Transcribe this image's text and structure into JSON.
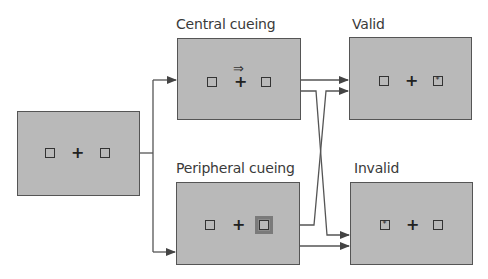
{
  "diagram": {
    "type": "flow",
    "nodes": [
      {
        "id": "fixation",
        "label": "",
        "content": {
          "left": "box",
          "center": "+",
          "right": "box"
        }
      },
      {
        "id": "central",
        "label": "Central cueing",
        "content": {
          "left": "box",
          "center": "+",
          "cue": "⇒ (double arrow above fixation)",
          "right": "box"
        }
      },
      {
        "id": "peripheral",
        "label": "Peripheral cueing",
        "content": {
          "left": "box",
          "center": "+",
          "right": "highlighted box"
        }
      },
      {
        "id": "valid",
        "label": "Valid",
        "content": {
          "left": "box",
          "center": "+",
          "right": "box with target *"
        }
      },
      {
        "id": "invalid",
        "label": "Invalid",
        "content": {
          "left": "box with target *",
          "center": "+",
          "right": "box"
        }
      }
    ],
    "edges": [
      {
        "from": "fixation",
        "to": "central"
      },
      {
        "from": "fixation",
        "to": "peripheral"
      },
      {
        "from": "central",
        "to": "valid"
      },
      {
        "from": "central",
        "to": "invalid"
      },
      {
        "from": "peripheral",
        "to": "valid"
      },
      {
        "from": "peripheral",
        "to": "invalid"
      }
    ]
  },
  "labels": {
    "central": "Central cueing",
    "peripheral": "Peripheral cueing",
    "valid": "Valid",
    "invalid": "Invalid"
  },
  "symbols": {
    "fixation": "+",
    "cue_arrow": "⇒",
    "target": "*"
  },
  "colors": {
    "panel_fill": "#b9b9b9",
    "panel_border": "#555555",
    "connector": "#555555",
    "text": "#3a3a3a"
  }
}
